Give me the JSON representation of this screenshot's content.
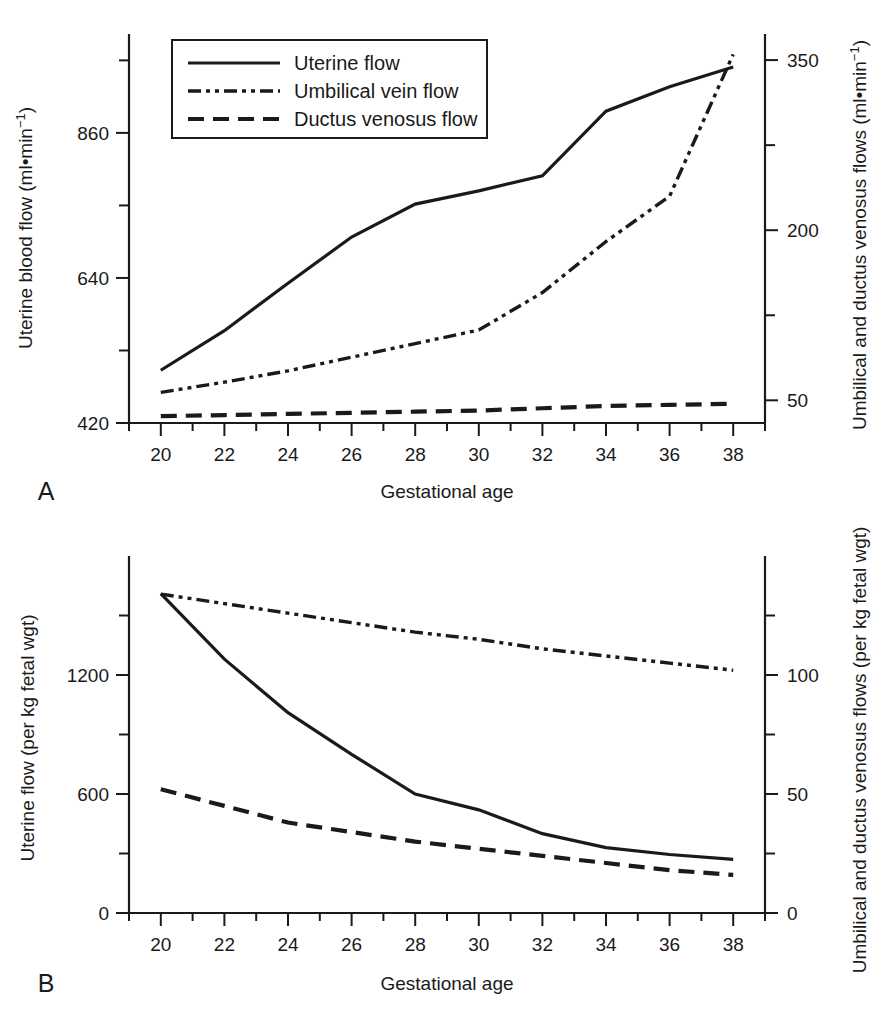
{
  "figure": {
    "panels": [
      {
        "letter": "A",
        "xlabel": "Gestational age",
        "ylabel_left": "Uterine blood flow (ml•min",
        "ylabel_left_sup": "−1",
        "ylabel_left_close": ")",
        "ylabel_right": "Umbilical and ductus venosus flows (ml•min",
        "ylabel_right_sup": "−1",
        "ylabel_right_close": ")",
        "xticks": [
          "20",
          "22",
          "24",
          "26",
          "28",
          "30",
          "32",
          "34",
          "36",
          "38"
        ],
        "yticks_left": [
          "420",
          "640",
          "860"
        ],
        "yticks_right": [
          "50",
          "200",
          "350"
        ]
      },
      {
        "letter": "B",
        "xlabel": "Gestational age",
        "ylabel_left": "Uterine flow (per kg fetal wgt)",
        "ylabel_right": "Umbilical and ductus venosus flows (per kg fetal wgt)",
        "xticks": [
          "20",
          "22",
          "24",
          "26",
          "28",
          "30",
          "32",
          "34",
          "36",
          "38"
        ],
        "yticks_left": [
          "0",
          "600",
          "1200"
        ],
        "yticks_right": [
          "0",
          "50",
          "100"
        ]
      }
    ],
    "legend": {
      "items": [
        {
          "label": "Uterine flow",
          "style": "solid"
        },
        {
          "label": "Umbilical vein flow",
          "style": "dash-dot-dot"
        },
        {
          "label": "Ductus venosus flow",
          "style": "dashed"
        }
      ]
    },
    "colors": {
      "ink": "#1a1a1a",
      "background": "#ffffff"
    }
  },
  "chart_data": [
    {
      "type": "line",
      "panel": "A",
      "title": "",
      "xlabel": "Gestational age",
      "ylabel": "Uterine blood flow (ml•min−1)",
      "ylabel_right": "Umbilical and ductus venosus flows (ml•min−1)",
      "x": [
        20,
        22,
        24,
        26,
        28,
        30,
        32,
        34,
        36,
        38
      ],
      "xlim": [
        19,
        39
      ],
      "ylim_left": [
        420,
        1010
      ],
      "ylim_right": [
        30,
        373
      ],
      "yticks_left": [
        420,
        640,
        860
      ],
      "yticks_right": [
        50,
        200,
        350
      ],
      "grid": false,
      "legend_position": "top-left-inside",
      "series": [
        {
          "name": "Uterine flow",
          "axis": "left",
          "style": "solid",
          "units": "ml•min−1",
          "values": [
            500,
            560,
            632,
            702,
            752,
            772,
            795,
            893,
            930,
            960
          ]
        },
        {
          "name": "Umbilical vein flow",
          "axis": "right",
          "style": "dash-dot-dot",
          "units": "ml•min−1",
          "values": [
            57,
            66,
            76,
            88,
            100,
            112,
            145,
            190,
            230,
            355
          ]
        },
        {
          "name": "Ductus venosus flow",
          "axis": "right",
          "style": "dashed",
          "units": "ml•min−1",
          "values": [
            36,
            37,
            38,
            39,
            40,
            41,
            43,
            45,
            46,
            47
          ]
        }
      ]
    },
    {
      "type": "line",
      "panel": "B",
      "title": "",
      "xlabel": "Gestational age",
      "ylabel": "Uterine flow (per kg fetal wgt)",
      "ylabel_right": "Umbilical and ductus venosus flows (per kg fetal wgt)",
      "x": [
        20,
        22,
        24,
        26,
        28,
        30,
        32,
        34,
        36,
        38
      ],
      "xlim": [
        19,
        39
      ],
      "ylim_left": [
        0,
        1800
      ],
      "ylim_right": [
        0,
        150
      ],
      "yticks_left": [
        0,
        600,
        1200
      ],
      "yticks_right": [
        0,
        50,
        100
      ],
      "grid": false,
      "legend_position": "none",
      "series": [
        {
          "name": "Uterine flow",
          "axis": "left",
          "style": "solid",
          "units": "ml per kg fetal wgt",
          "values": [
            1610,
            1280,
            1010,
            800,
            600,
            520,
            400,
            330,
            295,
            270
          ]
        },
        {
          "name": "Umbilical vein flow",
          "axis": "right",
          "style": "dash-dot-dot",
          "units": "ml per kg fetal wgt",
          "values": [
            134,
            130,
            126,
            122,
            118,
            115,
            111,
            108,
            105,
            102
          ]
        },
        {
          "name": "Ductus venosus flow",
          "axis": "right",
          "style": "dashed",
          "units": "ml per kg fetal wgt",
          "values": [
            52,
            45,
            38,
            34,
            30,
            27,
            24,
            21,
            18,
            16
          ]
        }
      ]
    }
  ]
}
